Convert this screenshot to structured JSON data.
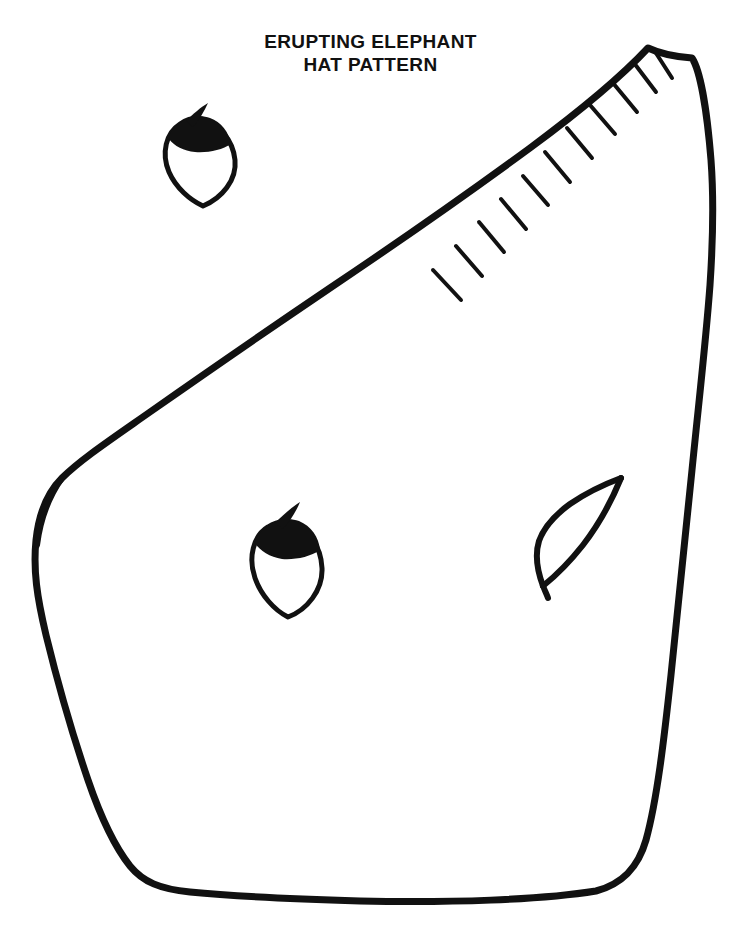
{
  "page": {
    "width": 741,
    "height": 947,
    "background_color": "#ffffff",
    "ink_color": "#111111",
    "document_type": "printable craft pattern template"
  },
  "title": {
    "line1": "ERUPTING ELEPHANT",
    "line2": "HAT PATTERN",
    "full_text": "ERUPTING ELEPHANT HAT PATTERN",
    "align": "center",
    "weight": "bold",
    "color": "#111111"
  },
  "shapes": {
    "main_body": {
      "name": "elephant-head-body-outline",
      "description": "Large closed freehand outline forming the elephant head hat body piece",
      "stroke_width": 7,
      "bounds": {
        "x": 35,
        "y": 45,
        "width": 678,
        "height": 860
      },
      "apex_point": {
        "x": 648,
        "y": 48
      },
      "leftmost_point": {
        "x": 35,
        "y": 585
      },
      "rightmost_point": {
        "x": 713,
        "y": 225
      },
      "bottom_point": {
        "x": 400,
        "y": 902
      }
    },
    "ear_small": {
      "name": "small-ear-piece",
      "description": "Small leaf-shaped ear piece with solid black cap and pointed tail",
      "stroke_width": 5,
      "bounds": {
        "x": 163,
        "y": 100,
        "width": 74,
        "height": 108
      }
    },
    "ear_large": {
      "name": "large-ear-piece",
      "description": "Larger leaf-shaped ear piece with solid black cap and pointed tail",
      "stroke_width": 5,
      "bounds": {
        "x": 252,
        "y": 498,
        "width": 72,
        "height": 120
      }
    },
    "tusk_leaf": {
      "name": "tusk-leaf-piece",
      "description": "Open leaf / tusk shaped outline on the lower right of the body",
      "stroke_width": 6,
      "bounds": {
        "x": 538,
        "y": 470,
        "width": 88,
        "height": 128
      }
    },
    "hatch_marks": {
      "name": "fringe-hatch-marks",
      "description": "Short tick marks along the upper-left diagonal edge indicating fringe cuts",
      "count": 11,
      "stroke_width": 4,
      "bases": [
        {
          "x": 433,
          "y": 270
        },
        {
          "x": 456,
          "y": 246
        },
        {
          "x": 479,
          "y": 222
        },
        {
          "x": 501,
          "y": 199
        },
        {
          "x": 523,
          "y": 176
        },
        {
          "x": 545,
          "y": 152
        },
        {
          "x": 567,
          "y": 128
        },
        {
          "x": 590,
          "y": 105
        },
        {
          "x": 613,
          "y": 83
        },
        {
          "x": 634,
          "y": 63
        },
        {
          "x": 654,
          "y": 50
        }
      ],
      "tips": [
        {
          "x": 461,
          "y": 300
        },
        {
          "x": 482,
          "y": 276
        },
        {
          "x": 504,
          "y": 252
        },
        {
          "x": 526,
          "y": 229
        },
        {
          "x": 548,
          "y": 205
        },
        {
          "x": 570,
          "y": 182
        },
        {
          "x": 592,
          "y": 158
        },
        {
          "x": 615,
          "y": 134
        },
        {
          "x": 637,
          "y": 112
        },
        {
          "x": 656,
          "y": 92
        },
        {
          "x": 672,
          "y": 78
        }
      ]
    }
  }
}
